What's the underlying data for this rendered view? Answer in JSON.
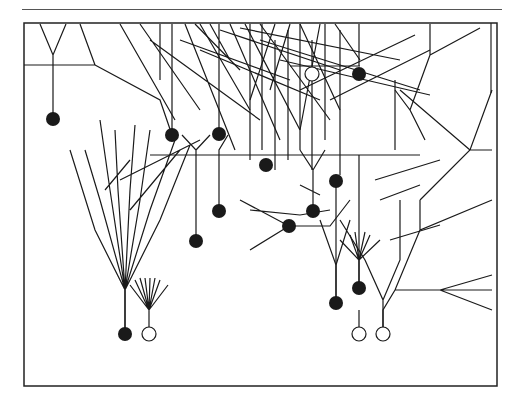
{
  "page": {
    "header_text": "",
    "header_rule": true
  },
  "figure": {
    "frame": {
      "x": 24,
      "y": 23,
      "width": 473,
      "height": 363,
      "stroke": "#222222"
    },
    "colors": {
      "line": "#1a1a1a",
      "filled_cell": "#1a1a1a",
      "hollow_cell": "#ffffff"
    },
    "cells": [
      {
        "id": "c1",
        "x": 53,
        "y": 119,
        "type": "filled"
      },
      {
        "id": "c2",
        "x": 172,
        "y": 135,
        "type": "filled"
      },
      {
        "id": "c3",
        "x": 219,
        "y": 134,
        "type": "filled"
      },
      {
        "id": "c4",
        "x": 266,
        "y": 165,
        "type": "filled"
      },
      {
        "id": "c5",
        "x": 336,
        "y": 181,
        "type": "filled"
      },
      {
        "id": "c6",
        "x": 219,
        "y": 211,
        "type": "filled"
      },
      {
        "id": "c7",
        "x": 313,
        "y": 211,
        "type": "filled"
      },
      {
        "id": "c8",
        "x": 196,
        "y": 241,
        "type": "filled"
      },
      {
        "id": "c9",
        "x": 289,
        "y": 226,
        "type": "filled"
      },
      {
        "id": "c10",
        "x": 359,
        "y": 74,
        "type": "filled"
      },
      {
        "id": "c11",
        "x": 125,
        "y": 334,
        "type": "filled"
      },
      {
        "id": "c12",
        "x": 336,
        "y": 303,
        "type": "filled"
      },
      {
        "id": "c13",
        "x": 359,
        "y": 288,
        "type": "filled"
      },
      {
        "id": "h1",
        "x": 312,
        "y": 74,
        "type": "hollow"
      },
      {
        "id": "h2",
        "x": 149,
        "y": 334,
        "type": "hollow"
      },
      {
        "id": "h3",
        "x": 359,
        "y": 334,
        "type": "hollow"
      },
      {
        "id": "h4",
        "x": 383,
        "y": 334,
        "type": "hollow"
      }
    ]
  }
}
